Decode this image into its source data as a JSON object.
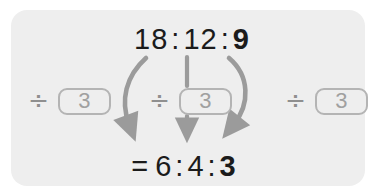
{
  "panel": {
    "background_color": "#eeeeee",
    "label": "ratio-simplification-diagram"
  },
  "colors": {
    "text": "#1b1b1b",
    "muted": "#a0a0a0",
    "box_border": "#b4b4b4",
    "arrow": "#9b9b9b",
    "panel": "#eeeeee",
    "page": "#ffffff"
  },
  "top_row": {
    "values": [
      "18",
      "12",
      "9"
    ],
    "separator": ":",
    "bold_index": 2
  },
  "bottom_row": {
    "equals": "=",
    "values": [
      "6",
      "4",
      "3"
    ],
    "separator": ":",
    "bold_index": 2
  },
  "operations": [
    {
      "symbol": "÷",
      "divisor": "3",
      "target": "18",
      "arrow": "curve-left"
    },
    {
      "symbol": "÷",
      "divisor": "3",
      "target": "12",
      "arrow": "straight"
    },
    {
      "symbol": "÷",
      "divisor": "3",
      "target": "9",
      "arrow": "curve-right"
    }
  ],
  "arrows": {
    "count": 3,
    "direction": "down",
    "color": "#9b9b9b"
  }
}
